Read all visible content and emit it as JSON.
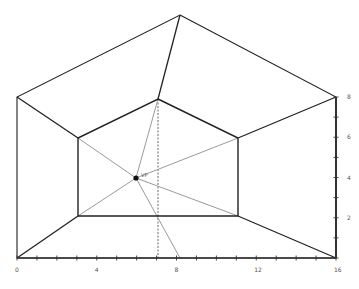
{
  "diagram": {
    "type": "perspective-drawing",
    "vp_label": "VP",
    "colors": {
      "outline": "#222222",
      "guide": "#9a9a9a",
      "axis": "#333333",
      "vp": "#111111"
    },
    "outer_pentagon": [
      [
        180,
        15
      ],
      [
        336,
        97
      ],
      [
        336,
        258
      ],
      [
        17,
        258
      ],
      [
        17,
        97
      ]
    ],
    "inner_pentagon": [
      [
        158,
        99
      ],
      [
        238,
        138
      ],
      [
        238,
        216
      ],
      [
        78,
        216
      ],
      [
        78,
        138
      ]
    ],
    "connectors": [
      [
        [
          180,
          15
        ],
        [
          158,
          99
        ]
      ],
      [
        [
          336,
          97
        ],
        [
          238,
          138
        ]
      ],
      [
        [
          336,
          258
        ],
        [
          238,
          216
        ]
      ],
      [
        [
          17,
          258
        ],
        [
          78,
          216
        ]
      ],
      [
        [
          17,
          97
        ],
        [
          78,
          138
        ]
      ]
    ],
    "vanishing_point": [
      136,
      178
    ],
    "guide_lines": [
      [
        [
          136,
          178
        ],
        [
          158,
          99
        ]
      ],
      [
        [
          136,
          178
        ],
        [
          238,
          138
        ]
      ],
      [
        [
          136,
          178
        ],
        [
          238,
          216
        ]
      ],
      [
        [
          136,
          178
        ],
        [
          78,
          216
        ]
      ],
      [
        [
          136,
          178
        ],
        [
          78,
          138
        ]
      ],
      [
        [
          136,
          178
        ],
        [
          180,
          258
        ]
      ]
    ],
    "dashed_vertical": [
      [
        158,
        99
      ],
      [
        158,
        258
      ]
    ]
  },
  "x_axis": {
    "ticks": [
      0,
      1,
      2,
      3,
      4,
      5,
      6,
      7,
      8,
      9,
      10,
      11,
      12,
      13,
      14,
      15,
      16
    ],
    "labels": [
      "0",
      "4",
      "8",
      "12",
      "16"
    ],
    "label_values": [
      0,
      4,
      8,
      12,
      16
    ]
  },
  "y_axis": {
    "ticks": [
      0,
      1,
      2,
      3,
      4,
      5,
      6,
      7,
      8
    ],
    "labels": [
      "2",
      "4",
      "6",
      "8"
    ],
    "label_values": [
      2,
      4,
      6,
      8
    ]
  }
}
